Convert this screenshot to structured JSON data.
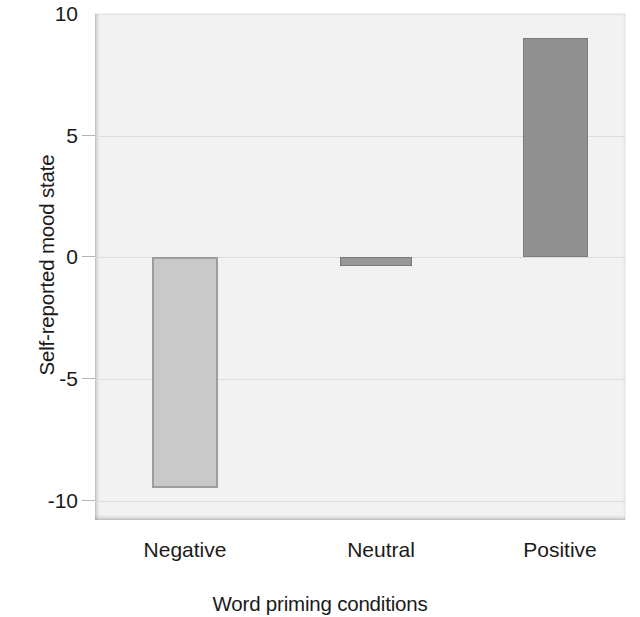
{
  "chart_data": {
    "type": "bar",
    "title": "",
    "subtitle": "",
    "xlabel": "Word priming conditions",
    "ylabel": "Self-reported mood state",
    "categories": [
      "Negative",
      "Neutral",
      "Positive"
    ],
    "values": [
      -9.5,
      -0.35,
      9.0
    ],
    "ylim": [
      -10,
      10
    ],
    "yticks": [
      10,
      5,
      0,
      -5,
      -10
    ],
    "ytick_labels": [
      "10",
      "5",
      "0",
      "-5",
      "-10"
    ],
    "grid": true,
    "legend": "none",
    "annotations": [],
    "bar_colors": [
      "#c9c9c9",
      "#989898",
      "#909090"
    ],
    "bar_border_colors": [
      "#9d9d9d",
      "#787878",
      "#7a7a7a"
    ],
    "plot_background": "#f2f2f2",
    "figure_background": "#ffffff",
    "gridline_color": "#dcdcdc",
    "text_color": "#1a1a1a"
  },
  "axes": {
    "y_tick_0": "10",
    "y_tick_1": "5",
    "y_tick_2": "0",
    "y_tick_3": "-5",
    "y_tick_4": "-10",
    "x_tick_0": "Negative",
    "x_tick_1": "Neutral",
    "x_tick_2": "Positive",
    "y_axis_title": "Self-reported mood state",
    "x_axis_title": "Word priming conditions"
  }
}
